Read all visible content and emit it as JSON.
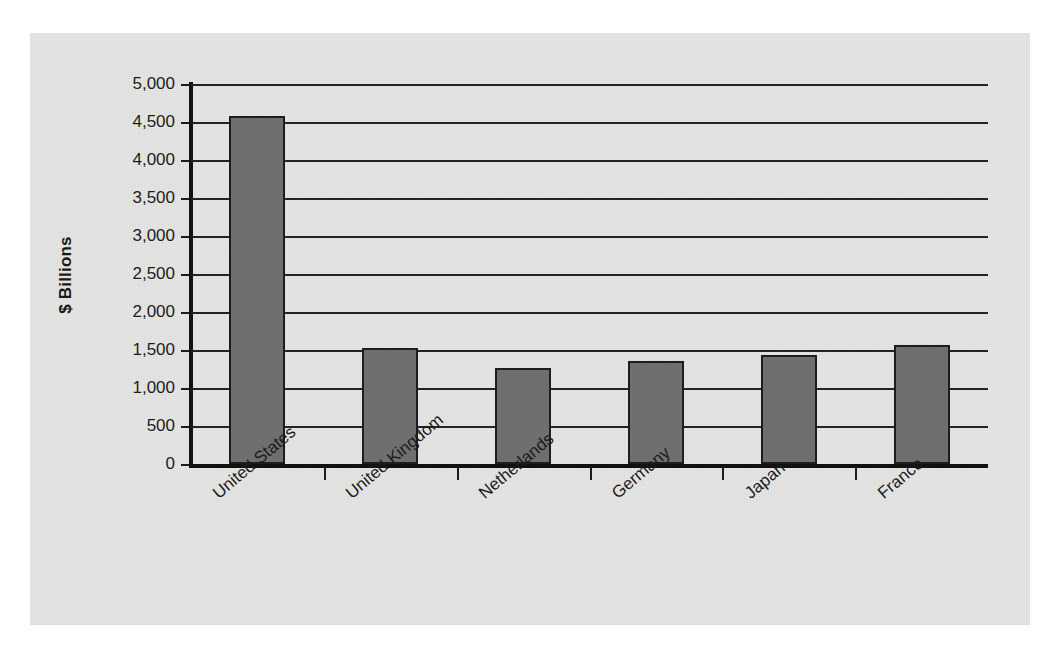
{
  "chart_data": {
    "type": "bar",
    "title": "",
    "xlabel": "",
    "ylabel": "$ Billions",
    "ylim": [
      0,
      5000
    ],
    "ytick_step": 500,
    "grid": true,
    "legend": false,
    "categories": [
      "United States",
      "United Kingdom",
      "Netherlands",
      "Germany",
      "Japan",
      "France"
    ],
    "values": [
      4580,
      1530,
      1260,
      1350,
      1440,
      1570
    ],
    "ytick_labels": [
      "5,000",
      "4,500",
      "4,000",
      "3,500",
      "3,000",
      "2,500",
      "2,000",
      "1,500",
      "1,000",
      "500",
      "0"
    ],
    "ytick_values": [
      5000,
      4500,
      4000,
      3500,
      3000,
      2500,
      2000,
      1500,
      1000,
      500,
      0
    ],
    "bar_color": "#6f6f6f",
    "bar_edge_color": "#1d1d1d",
    "axis_color": "#111111",
    "plot_background": "#e4e4e2",
    "page_background": "#ffffff"
  }
}
